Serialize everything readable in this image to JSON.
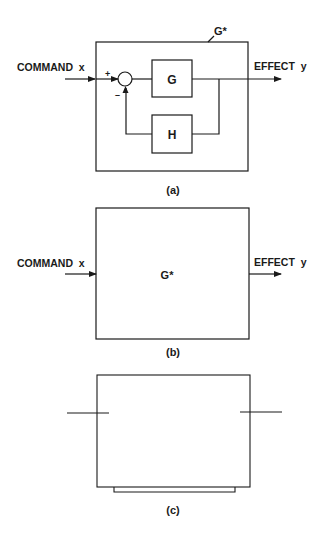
{
  "diagrams": [
    {
      "id": "a",
      "caption": "(a)",
      "outer_label": "G*",
      "input_label": "COMMAND  x",
      "output_label": "EFFECT  y",
      "forward_block": "G",
      "feedback_block": "H",
      "summing_plus": "+",
      "summing_minus": "–"
    },
    {
      "id": "b",
      "caption": "(b)",
      "block_label": "G*",
      "input_label": "COMMAND  x",
      "output_label": "EFFECT  y"
    },
    {
      "id": "c",
      "caption": "(c)"
    }
  ],
  "colors": {
    "line": "#1a1a1a",
    "background": "#ffffff"
  }
}
